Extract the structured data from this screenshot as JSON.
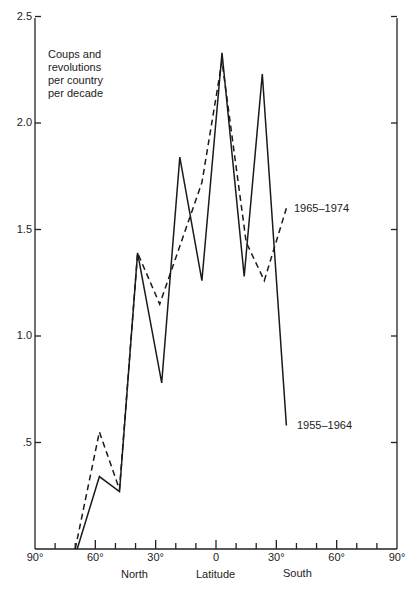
{
  "chart_data": {
    "type": "line",
    "title": "Coups and revolutions per country per decade",
    "title_lines": [
      "Coups and",
      "revolutions",
      "per country",
      "per decade"
    ],
    "xlabel": "Latitude",
    "xlabel_north": "North",
    "xlabel_south": "South",
    "ylabel": "",
    "xlim": [
      -90,
      90
    ],
    "ylim": [
      0,
      2.5
    ],
    "grid": false,
    "y_ticks": [
      {
        "value": 0.5,
        "label": ".5"
      },
      {
        "value": 1.0,
        "label": "1.0"
      },
      {
        "value": 1.5,
        "label": "1.5"
      },
      {
        "value": 2.0,
        "label": "2.0"
      },
      {
        "value": 2.5,
        "label": "2.5"
      }
    ],
    "x_ticks": [
      {
        "value": -90,
        "label": "90°"
      },
      {
        "value": -60,
        "label": "60°"
      },
      {
        "value": -30,
        "label": "30°"
      },
      {
        "value": 0,
        "label": "0"
      },
      {
        "value": 30,
        "label": "30°"
      },
      {
        "value": 60,
        "label": "60°"
      },
      {
        "value": 90,
        "label": "90°"
      }
    ],
    "x_note": "Negative latitude values denote North, positive denote South",
    "series": [
      {
        "name": "1955–1964",
        "style": "solid",
        "x": [
          -69,
          -58,
          -48,
          -39,
          -27,
          -18,
          -7,
          3,
          14,
          23,
          35
        ],
        "values": [
          0.0,
          0.34,
          0.27,
          1.39,
          0.78,
          1.84,
          1.26,
          2.33,
          1.28,
          2.23,
          0.58
        ]
      },
      {
        "name": "1965–1974",
        "style": "dashed",
        "x": [
          -70,
          -58,
          -48,
          -39,
          -28,
          -7,
          3,
          15,
          24,
          35
        ],
        "values": [
          0.0,
          0.55,
          0.28,
          1.39,
          1.15,
          1.72,
          2.29,
          1.44,
          1.26,
          1.6
        ]
      }
    ],
    "legend": "inline labels at line ends"
  }
}
